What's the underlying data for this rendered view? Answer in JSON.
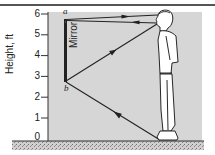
{
  "figure": {
    "y_axis_label": "Height, ft",
    "y_ticks": [
      "0",
      "1",
      "2",
      "3",
      "4",
      "5",
      "6"
    ],
    "mirror_label": "Mirror",
    "point_top_label": "a",
    "point_bottom_label": "b",
    "colors": {
      "panel": "#d6d6d6",
      "lines": "#222222",
      "ground": "#bdbdbd",
      "background": "#ffffff"
    },
    "elements": [
      "mirror-vertical-strip",
      "person-standing-figure",
      "ray-eye-to-mirror-top",
      "ray-mirror-top-to-eye",
      "ray-eye-to-mirror-bottom",
      "ray-feet-to-mirror-bottom",
      "ground-hatched-band"
    ]
  }
}
